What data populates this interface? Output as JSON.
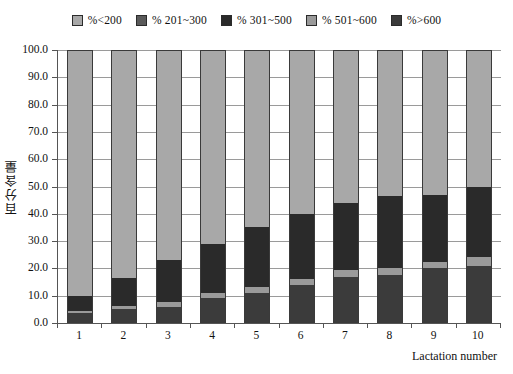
{
  "chart_data": {
    "type": "bar",
    "subtype": "stacked-100-percent",
    "title": "",
    "xlabel": "Lactation number",
    "ylabel": "百分含量",
    "ylim": [
      0,
      100
    ],
    "ytick_step": 10,
    "ytick_labels": [
      "100.0",
      "90.0",
      "80.0",
      "70.0",
      "60.0",
      "50.0",
      "40.0",
      "30.0",
      "20.0",
      "10.0",
      "0.0"
    ],
    "ytick_values": [
      100,
      90,
      80,
      70,
      60,
      50,
      40,
      30,
      20,
      10,
      0
    ],
    "grid": true,
    "legend_position": "top",
    "categories": [
      "1",
      "2",
      "3",
      "4",
      "5",
      "6",
      "7",
      "8",
      "9",
      "10"
    ],
    "stack_order_bottom_to_top": [
      "%>600",
      "% 501~600",
      "% 301~500",
      "% 201~300",
      "%<200"
    ],
    "series": [
      {
        "name": "%>600",
        "color": "#3b3b3b",
        "values": [
          3.5,
          5.0,
          6.0,
          9.0,
          11.0,
          14.0,
          17.0,
          17.5,
          20.0,
          21.0
        ]
      },
      {
        "name": "% 501~600",
        "color": "#9a9a9a",
        "values": [
          0.8,
          1.2,
          1.6,
          2.0,
          2.2,
          2.0,
          2.5,
          2.5,
          2.5,
          3.0
        ]
      },
      {
        "name": "% 301~500",
        "color": "#2a2a2a",
        "values": [
          5.7,
          10.3,
          15.4,
          18.0,
          21.8,
          24.0,
          24.5,
          26.5,
          24.5,
          26.0
        ]
      },
      {
        "name": "% 201~300",
        "color": "#5a5a5a",
        "values": [
          0.0,
          0.0,
          0.0,
          0.0,
          0.0,
          0.0,
          0.0,
          0.0,
          0.0,
          0.0
        ]
      },
      {
        "name": "%<200",
        "color": "#a8a8a8",
        "values": [
          90.0,
          83.5,
          77.0,
          71.0,
          65.0,
          60.0,
          56.0,
          53.5,
          53.0,
          50.0
        ]
      }
    ],
    "bar_tops_cumulative": {
      "%>600": [
        3.5,
        5.0,
        6.0,
        9.0,
        11.0,
        14.0,
        17.0,
        17.5,
        20.0,
        21.0
      ],
      "% 501~600": [
        4.3,
        6.2,
        7.6,
        11.0,
        13.2,
        16.0,
        19.5,
        20.0,
        22.5,
        24.0
      ],
      "% 301~500": [
        10.0,
        16.5,
        23.0,
        29.0,
        35.0,
        40.0,
        44.0,
        46.5,
        47.0,
        50.0
      ],
      "%<200": [
        100,
        100,
        100,
        100,
        100,
        100,
        100,
        100,
        100,
        100
      ]
    }
  },
  "legend": {
    "entries": [
      {
        "label": "%<200",
        "color": "#a8a8a8"
      },
      {
        "label": "% 201~300",
        "color": "#5a5a5a"
      },
      {
        "label": "% 301~500",
        "color": "#2a2a2a"
      },
      {
        "label": "% 501~600",
        "color": "#9a9a9a"
      },
      {
        "label": "%>600",
        "color": "#3b3b3b"
      }
    ]
  },
  "axes": {
    "y_title": "百分含量",
    "x_title": "Lactation number"
  }
}
